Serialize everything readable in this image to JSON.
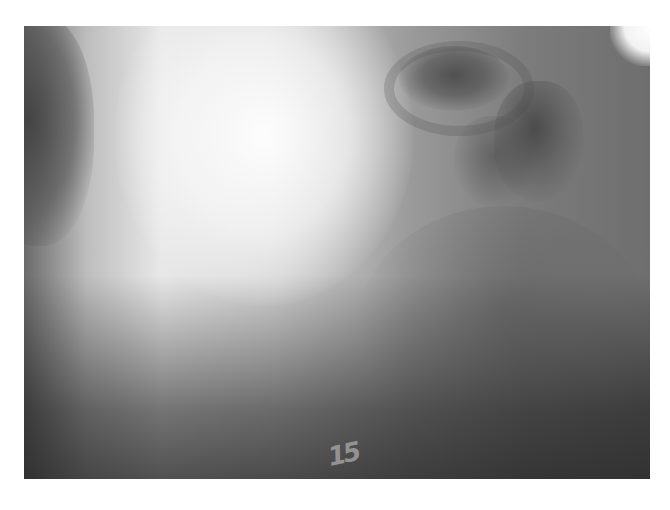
{
  "image": {
    "type": "radiograph",
    "description": "Grayscale X-ray of skull/face region, lateral view",
    "marker_text": "15",
    "colors": {
      "background": "#ffffff",
      "bright_region": "#f0f0f0",
      "dark_region": "#3a3a3a"
    }
  }
}
